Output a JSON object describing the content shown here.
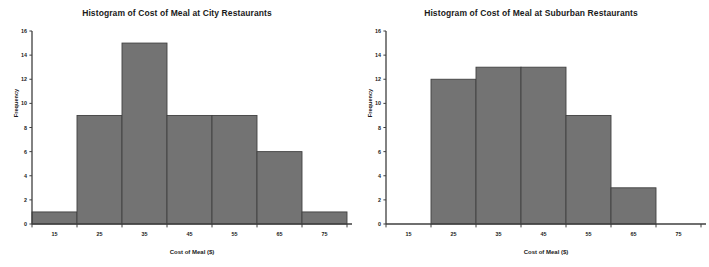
{
  "page": {
    "background_color": "#ffffff",
    "width": 709,
    "height": 267
  },
  "style": {
    "bar_fill": "#737373",
    "bar_stroke": "#404040",
    "axis_color": "#3f3f3f",
    "text_color": "#1a1a1a"
  },
  "charts": [
    {
      "id": "city",
      "title": "Histogram of Cost of Meal at City Restaurants",
      "xlabel": "Cost of Meal ($)",
      "ylabel": "Frequency"
    },
    {
      "id": "suburban",
      "title": "Histogram of Cost of Meal at Suburban Restaurants",
      "xlabel": "Cost of Meal ($)",
      "ylabel": "Frequency"
    }
  ],
  "chart_data": [
    {
      "type": "bar",
      "subtype": "histogram",
      "title": "Histogram of Cost of Meal at City Restaurants",
      "xlabel": "Cost of Meal ($)",
      "ylabel": "Frequency",
      "categories": [
        "15",
        "25",
        "35",
        "45",
        "55",
        "65",
        "75"
      ],
      "bin_edges": [
        10,
        20,
        30,
        40,
        50,
        60,
        70,
        80
      ],
      "bin_centers": [
        15,
        25,
        35,
        45,
        55,
        65,
        75
      ],
      "values": [
        1,
        9,
        15,
        9,
        9,
        6,
        1
      ],
      "xlim": [
        10,
        80
      ],
      "ylim": [
        0,
        16
      ],
      "ytick_labels": [
        "0",
        "2",
        "4",
        "6",
        "8",
        "10",
        "12",
        "14",
        "16"
      ],
      "yticks": [
        0,
        2,
        4,
        6,
        8,
        10,
        12,
        14,
        16
      ],
      "xtick_labels": [
        "15",
        "25",
        "35",
        "45",
        "55",
        "65",
        "75"
      ],
      "grid": false,
      "legend": false
    },
    {
      "type": "bar",
      "subtype": "histogram",
      "title": "Histogram of Cost of Meal at Suburban Restaurants",
      "xlabel": "Cost of Meal ($)",
      "ylabel": "Frequency",
      "categories": [
        "15",
        "25",
        "35",
        "45",
        "55",
        "65",
        "75"
      ],
      "bin_edges": [
        10,
        20,
        30,
        40,
        50,
        60,
        70,
        80
      ],
      "bin_centers": [
        15,
        25,
        35,
        45,
        55,
        65,
        75
      ],
      "values": [
        0,
        12,
        13,
        13,
        9,
        3,
        0
      ],
      "xlim": [
        10,
        80
      ],
      "ylim": [
        0,
        16
      ],
      "ytick_labels": [
        "0",
        "2",
        "4",
        "6",
        "8",
        "10",
        "12",
        "14",
        "16"
      ],
      "yticks": [
        0,
        2,
        4,
        6,
        8,
        10,
        12,
        14,
        16
      ],
      "xtick_labels": [
        "15",
        "25",
        "35",
        "45",
        "55",
        "65",
        "75"
      ],
      "grid": false,
      "legend": false
    }
  ]
}
